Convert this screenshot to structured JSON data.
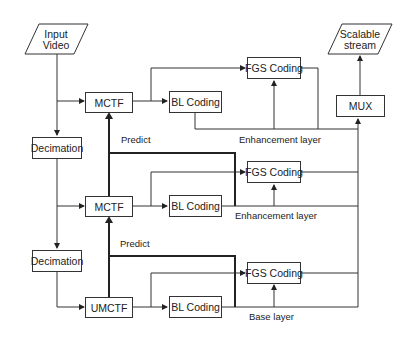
{
  "diagram": {
    "nodes": {
      "input_video": {
        "line1": "Input",
        "line2": "Video"
      },
      "scalable_stream": {
        "line1": "Scalable",
        "line2": "stream"
      },
      "mctf_top": "MCTF",
      "mctf_mid": "MCTF",
      "umctf": "UMCTF",
      "decimation_1": "Decimation",
      "decimation_2": "Decimation",
      "bl_top": "BL Coding",
      "bl_mid": "BL Coding",
      "bl_bot": "BL Coding",
      "fgs_top": "FGS Coding",
      "fgs_mid": "FGS Coding",
      "fgs_bot": "FGS Coding",
      "mux": "MUX"
    },
    "labels": {
      "predict_1": "Predict",
      "predict_2": "Predict",
      "enhancement_1": "Enhancement layer",
      "enhancement_2": "Enhancement layer",
      "base": "Base  layer"
    },
    "colors": {
      "stroke": "#333333",
      "background": "#ffffff"
    }
  }
}
